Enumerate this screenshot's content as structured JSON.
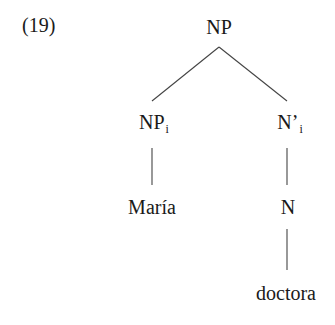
{
  "example_number": "(19)",
  "tree": {
    "root": {
      "label": "NP",
      "subscript": ""
    },
    "left": {
      "label": "NP",
      "subscript": "i",
      "terminal": "María"
    },
    "right": {
      "label": "N’",
      "subscript": "i",
      "child": {
        "label": "N",
        "terminal": "doctora"
      }
    }
  }
}
